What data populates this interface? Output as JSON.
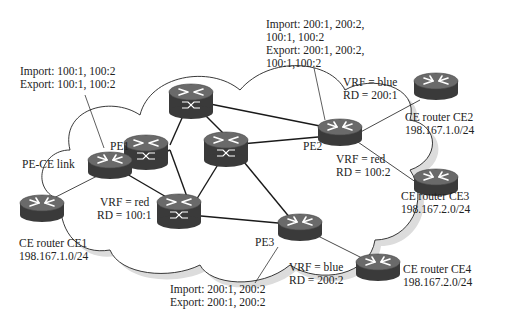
{
  "diagram": {
    "type": "MPLS L3VPN network topology",
    "provider_edges": [
      {
        "id": "PE1",
        "label": "PE1",
        "vrf": "VRF = red",
        "rd": "RD = 100:1",
        "import": "Import: 100:1, 100:2",
        "export": "Export: 100:1, 100:2"
      },
      {
        "id": "PE2",
        "label": "PE2",
        "vrf_blue": "VRF = blue",
        "rd_blue": "RD = 200:1",
        "vrf_red": "VRF = red",
        "rd_red": "RD = 100:2",
        "import_line1": "Import: 200:1, 200:2,",
        "import_line2": "100:1, 100:2",
        "export_line1": "Export: 200:1, 200:2,",
        "export_line2": "100:1,100:2"
      },
      {
        "id": "PE3",
        "label": "PE3",
        "vrf": "VRF = blue",
        "rd": "RD = 200:2",
        "import": "Import: 200:1, 200:2",
        "export": "Export: 200:1, 200:2"
      }
    ],
    "customer_edges": [
      {
        "id": "CE1",
        "name": "CE router CE1",
        "subnet": "198.167.1.0/24"
      },
      {
        "id": "CE2",
        "name": "CE router CE2",
        "subnet": "198.167.1.0/24"
      },
      {
        "id": "CE3",
        "name": "CE router CE3",
        "subnet": "198.167.2.0/24"
      },
      {
        "id": "CE4",
        "name": "CE router CE4",
        "subnet": "198.167.2.0/24"
      }
    ],
    "link_label": "PE-CE link",
    "colors": {
      "router_top": "#6e6e6e",
      "router_side": "#3c3c3c",
      "cloud_shadow": "#d6d6d6",
      "line": "#1a1a1a"
    }
  }
}
